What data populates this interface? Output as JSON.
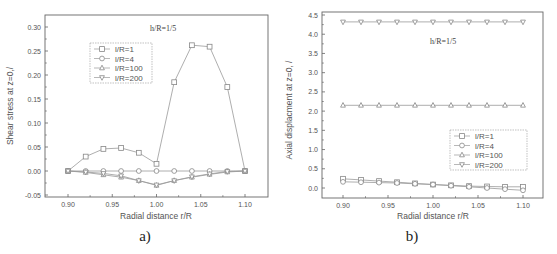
{
  "chart_data": [
    {
      "id": "a",
      "type": "line",
      "caption": "a)",
      "annotation": "h/R=1/5",
      "xlabel": "Radial distance r/R",
      "ylabel": "Shear stress at z=0,/",
      "xlim": [
        0.88,
        1.12
      ],
      "ylim": [
        -0.05,
        0.32
      ],
      "xticks": [
        "0.90",
        "0.95",
        "1.00",
        "1.05",
        "1.10"
      ],
      "yticks": [
        "-0.05",
        "0.00",
        "0.05",
        "0.10",
        "0.15",
        "0.20",
        "0.25",
        "0.30"
      ],
      "x": [
        0.9,
        0.92,
        0.94,
        0.96,
        0.98,
        1.0,
        1.02,
        1.04,
        1.06,
        1.08,
        1.1
      ],
      "legend_position": "upper-left",
      "series": [
        {
          "name": "l/R=1",
          "marker": "square",
          "values": [
            0.0,
            0.03,
            0.046,
            0.048,
            0.038,
            0.015,
            0.185,
            0.262,
            0.259,
            0.175,
            0.0
          ]
        },
        {
          "name": "l/R=4",
          "marker": "circle",
          "values": [
            0.0,
            0.0,
            0.0,
            0.0,
            0.0,
            0.0,
            0.0,
            0.0,
            0.0,
            0.0,
            0.0
          ]
        },
        {
          "name": "l/R=100",
          "marker": "triangle-up",
          "values": [
            0.0,
            -0.003,
            -0.008,
            -0.013,
            -0.02,
            -0.03,
            -0.02,
            -0.013,
            -0.007,
            -0.002,
            0.0
          ]
        },
        {
          "name": "l/R=200",
          "marker": "triangle-down",
          "values": [
            0.0,
            -0.002,
            -0.005,
            -0.01,
            -0.02,
            -0.029,
            -0.02,
            -0.012,
            -0.006,
            -0.001,
            0.0
          ]
        }
      ]
    },
    {
      "id": "b",
      "type": "line",
      "caption": "b)",
      "annotation": "h/R=1/5",
      "xlabel": "Radial distance r/R",
      "ylabel": "Axial displacment at z=0, /",
      "xlim": [
        0.88,
        1.12
      ],
      "ylim": [
        -0.3,
        4.5
      ],
      "xticks": [
        "0.90",
        "0.95",
        "1.00",
        "1.05",
        "1.10"
      ],
      "yticks": [
        "0.0",
        "0.5",
        "1.0",
        "1.5",
        "2.0",
        "2.5",
        "3.0",
        "3.5",
        "4.0",
        "4.5"
      ],
      "x": [
        0.9,
        0.92,
        0.94,
        0.96,
        0.98,
        1.0,
        1.02,
        1.04,
        1.06,
        1.08,
        1.1
      ],
      "legend_position": "lower-right",
      "series": [
        {
          "name": "l/R=1",
          "marker": "square",
          "values": [
            0.24,
            0.21,
            0.18,
            0.15,
            0.12,
            0.09,
            0.07,
            0.05,
            0.04,
            0.03,
            0.03
          ]
        },
        {
          "name": "l/R=4",
          "marker": "circle",
          "values": [
            0.16,
            0.15,
            0.14,
            0.13,
            0.11,
            0.09,
            0.06,
            0.03,
            0.0,
            -0.03,
            -0.06
          ]
        },
        {
          "name": "l/R=100",
          "marker": "triangle-up",
          "values": [
            2.15,
            2.15,
            2.15,
            2.15,
            2.15,
            2.15,
            2.15,
            2.15,
            2.15,
            2.15,
            2.15
          ]
        },
        {
          "name": "l/R=200",
          "marker": "triangle-down",
          "values": [
            4.32,
            4.32,
            4.32,
            4.32,
            4.32,
            4.32,
            4.32,
            4.32,
            4.32,
            4.32,
            4.32
          ]
        }
      ]
    }
  ]
}
